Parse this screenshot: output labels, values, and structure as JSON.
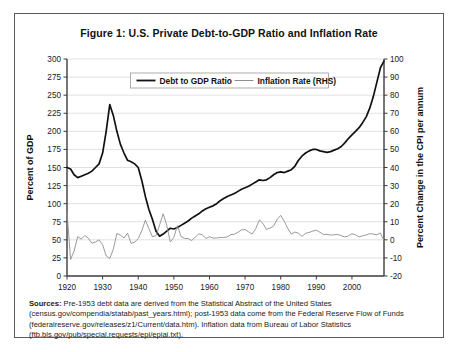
{
  "figure": {
    "title": "Figure 1: U.S. Private Debt-to-GDP Ratio and Inflation Rate",
    "sources_label": "Sources:",
    "sources_text": " Pre-1953 debt data are derived from the Statistical Abstract of the United States (census.gov/compendia/statab/past_years.html); post-1953 data come from the Federal Reserve Flow of Funds (federalreserve.gov/releases/z1/Current/data.htm). Inflation data from Bureau of Labor Statistics (ftb.bls.gov/pub/special.requests/epi/epiai.txt)."
  },
  "colors": {
    "debt_line": "#111111",
    "inflation_line": "#8f8f8f",
    "gridline": "#d9d9d9",
    "axis": "#3c3c3c",
    "frame": "#5a5a5a"
  },
  "chart_data": {
    "type": "line",
    "title": "Figure 1: U.S. Private Debt-to-GDP Ratio and Inflation Rate",
    "xlabel": "",
    "ylabel": "Percent of GDP",
    "y2label": "Percent Change in the CPI per annum",
    "xlim": [
      1920,
      2009
    ],
    "ylim": [
      0,
      300
    ],
    "y2lim": [
      -20,
      100
    ],
    "ytick_step": 25,
    "y2tick_step": 10,
    "xticks": [
      1920,
      1930,
      1940,
      1950,
      1960,
      1970,
      1980,
      1990,
      2000
    ],
    "yticks": [
      0,
      25,
      50,
      75,
      100,
      125,
      150,
      175,
      200,
      225,
      250,
      275,
      300
    ],
    "y2ticks": [
      -20,
      -10,
      0,
      10,
      20,
      30,
      40,
      50,
      60,
      70,
      80,
      90,
      100
    ],
    "grid": "horizontal",
    "legend_position": "top-center",
    "series": [
      {
        "name": "Debt to GDP Ratio",
        "axis": "left",
        "color": "#111111",
        "x": [
          1920,
          1921,
          1922,
          1923,
          1924,
          1925,
          1926,
          1927,
          1928,
          1929,
          1930,
          1931,
          1932,
          1933,
          1934,
          1935,
          1936,
          1937,
          1938,
          1939,
          1940,
          1941,
          1942,
          1943,
          1944,
          1945,
          1946,
          1947,
          1948,
          1949,
          1950,
          1951,
          1952,
          1953,
          1954,
          1955,
          1956,
          1957,
          1958,
          1959,
          1960,
          1961,
          1962,
          1963,
          1964,
          1965,
          1966,
          1967,
          1968,
          1969,
          1970,
          1971,
          1972,
          1973,
          1974,
          1975,
          1976,
          1977,
          1978,
          1979,
          1980,
          1981,
          1982,
          1983,
          1984,
          1985,
          1986,
          1987,
          1988,
          1989,
          1990,
          1991,
          1992,
          1993,
          1994,
          1995,
          1996,
          1997,
          1998,
          1999,
          2000,
          2001,
          2002,
          2003,
          2004,
          2005,
          2006,
          2007,
          2008,
          2009
        ],
        "values": [
          150,
          148,
          140,
          136,
          138,
          140,
          142,
          145,
          150,
          155,
          170,
          200,
          237,
          222,
          200,
          182,
          170,
          160,
          158,
          155,
          150,
          132,
          110,
          92,
          78,
          62,
          55,
          58,
          62,
          66,
          65,
          67,
          70,
          73,
          76,
          80,
          83,
          86,
          90,
          93,
          95,
          97,
          100,
          104,
          107,
          110,
          112,
          114,
          117,
          120,
          122,
          124,
          127,
          130,
          133,
          132,
          133,
          136,
          140,
          143,
          144,
          143,
          145,
          147,
          152,
          160,
          166,
          170,
          173,
          175,
          175,
          173,
          172,
          171,
          172,
          174,
          176,
          179,
          184,
          190,
          195,
          200,
          205,
          212,
          220,
          232,
          248,
          268,
          288,
          297
        ]
      },
      {
        "name": "Inflation Rate (RHS)",
        "axis": "right",
        "color": "#8f8f8f",
        "x": [
          1920,
          1921,
          1922,
          1923,
          1924,
          1925,
          1926,
          1927,
          1928,
          1929,
          1930,
          1931,
          1932,
          1933,
          1934,
          1935,
          1936,
          1937,
          1938,
          1939,
          1940,
          1941,
          1942,
          1943,
          1944,
          1945,
          1946,
          1947,
          1948,
          1949,
          1950,
          1951,
          1952,
          1953,
          1954,
          1955,
          1956,
          1957,
          1958,
          1959,
          1960,
          1961,
          1962,
          1963,
          1964,
          1965,
          1966,
          1967,
          1968,
          1969,
          1970,
          1971,
          1972,
          1973,
          1974,
          1975,
          1976,
          1977,
          1978,
          1979,
          1980,
          1981,
          1982,
          1983,
          1984,
          1985,
          1986,
          1987,
          1988,
          1989,
          1990,
          1991,
          1992,
          1993,
          1994,
          1995,
          1996,
          1997,
          1998,
          1999,
          2000,
          2001,
          2002,
          2003,
          2004,
          2005,
          2006,
          2007,
          2008,
          2009
        ],
        "values": [
          15.6,
          -10.9,
          -6.2,
          1.8,
          0.4,
          2.4,
          0.9,
          -1.9,
          -1.2,
          0.0,
          -2.7,
          -8.9,
          -10.3,
          -5.2,
          3.5,
          2.6,
          1.0,
          3.7,
          -2.0,
          -1.3,
          0.7,
          5.0,
          10.9,
          6.1,
          1.7,
          2.3,
          8.3,
          14.4,
          8.1,
          -1.2,
          1.3,
          7.9,
          1.9,
          0.8,
          0.7,
          -0.4,
          1.5,
          3.3,
          2.8,
          0.7,
          1.7,
          1.0,
          1.0,
          1.3,
          1.3,
          1.6,
          2.9,
          3.1,
          4.2,
          5.5,
          5.7,
          4.4,
          3.2,
          6.2,
          11.0,
          9.1,
          5.8,
          6.5,
          7.6,
          11.3,
          13.5,
          10.3,
          6.2,
          3.2,
          4.3,
          3.6,
          1.9,
          3.6,
          4.1,
          4.8,
          5.4,
          4.2,
          3.0,
          3.0,
          2.6,
          2.8,
          3.0,
          2.3,
          1.6,
          2.2,
          3.4,
          2.8,
          1.6,
          2.3,
          2.7,
          3.4,
          3.2,
          2.8,
          3.8,
          -0.4
        ]
      }
    ]
  },
  "legend": {
    "items": [
      {
        "label": "Debt to GDP Ratio",
        "color": "#111111"
      },
      {
        "label": "Inflation Rate (RHS)",
        "color": "#8f8f8f"
      }
    ]
  }
}
